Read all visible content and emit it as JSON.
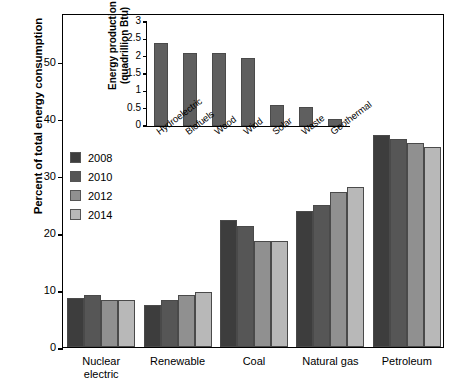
{
  "chart_data": [
    {
      "id": "main",
      "type": "bar",
      "title": "",
      "xlabel": "",
      "ylabel": "Percent of total energy consumption",
      "ylim": [
        0,
        58.5
      ],
      "yticks": [
        0,
        10,
        20,
        30,
        40,
        50
      ],
      "grid": false,
      "legend_position": "inside-left",
      "categories": [
        "Nuclear electric",
        "Renewable",
        "Coal",
        "Natural gas",
        "Petroleum"
      ],
      "category_lines": [
        [
          "Nuclear",
          "electric"
        ],
        [
          "Renewable"
        ],
        [
          "Coal"
        ],
        [
          "Natural gas"
        ],
        [
          "Petroleum"
        ]
      ],
      "series": [
        {
          "name": "2008",
          "color": "#3d3d3d",
          "values": [
            8.5,
            7.4,
            22.3,
            23.9,
            37.2
          ]
        },
        {
          "name": "2010",
          "color": "#565656",
          "values": [
            9.1,
            8.2,
            21.2,
            24.9,
            36.5
          ]
        },
        {
          "name": "2012",
          "color": "#909090",
          "values": [
            8.2,
            9.1,
            18.5,
            27.1,
            35.7
          ]
        },
        {
          "name": "2014",
          "color": "#b8b8b8",
          "values": [
            8.2,
            9.6,
            18.5,
            28.1,
            35.0
          ]
        }
      ]
    },
    {
      "id": "inset",
      "type": "bar",
      "title": "",
      "xlabel": "",
      "ylabel": "Energy production (quadrillion Btu)",
      "ylabel_lines": [
        "Energy production",
        "(quadrillion Btu)"
      ],
      "ylim": [
        0,
        3
      ],
      "yticks": [
        "0",
        "0.5",
        "1",
        "1.5",
        "2",
        "2.5",
        "3"
      ],
      "ytick_values": [
        0,
        0.5,
        1,
        1.5,
        2,
        2.5,
        3
      ],
      "grid": false,
      "categories": [
        "Hydroelectric",
        "Biofuels",
        "Wood",
        "Wind",
        "Solar",
        "Waste",
        "Geothermal"
      ],
      "series": [
        {
          "name": "Energy production",
          "color": "#5f5f5f",
          "values": [
            2.4,
            2.1,
            2.1,
            1.95,
            0.6,
            0.55,
            0.2
          ]
        }
      ]
    }
  ],
  "main": {
    "ylabel": "Percent of total energy consumption",
    "yticks": [
      "0",
      "10",
      "20",
      "30",
      "40",
      "50"
    ],
    "groups": [
      {
        "label_line1": "Nuclear",
        "label_line2": "electric"
      },
      {
        "label_line1": "Renewable",
        "label_line2": ""
      },
      {
        "label_line1": "Coal",
        "label_line2": ""
      },
      {
        "label_line1": "Natural gas",
        "label_line2": ""
      },
      {
        "label_line1": "Petroleum",
        "label_line2": ""
      }
    ]
  },
  "legend": {
    "items": [
      {
        "label": "2008",
        "color": "#3d3d3d"
      },
      {
        "label": "2010",
        "color": "#565656"
      },
      {
        "label": "2012",
        "color": "#909090"
      },
      {
        "label": "2014",
        "color": "#b8b8b8"
      }
    ]
  },
  "inset": {
    "ylabel_line1": "Energy production",
    "ylabel_line2": "(quadrillion Btu)",
    "yticks": [
      "3",
      "2.5",
      "2",
      "1.5",
      "1",
      "0.5",
      "0"
    ],
    "categories": [
      "Hydroelectric",
      "Biofuels",
      "Wood",
      "Wind",
      "Solar",
      "Waste",
      "Geothermal"
    ]
  }
}
